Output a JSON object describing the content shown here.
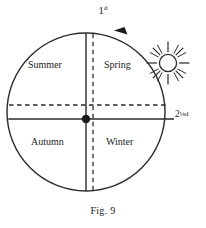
{
  "figure": {
    "caption": "Fig. 9",
    "labels": {
      "top_value": "1",
      "top_superscript": "d",
      "right_whole": "2",
      "right_fraction": "⅛",
      "right_unit": "d"
    },
    "seasons": [
      {
        "name": "Summer",
        "quadrant": "upper-left"
      },
      {
        "name": "Spring",
        "quadrant": "upper-right"
      },
      {
        "name": "Autumn",
        "quadrant": "lower-left"
      },
      {
        "name": "Winter",
        "quadrant": "lower-right"
      }
    ],
    "icons": {
      "sun": "sun-icon",
      "direction_arrow": "counterclockwise-arrow-icon",
      "center_point": "center-dot-icon"
    },
    "colors": {
      "ink": "#1a1a1a",
      "paper": "#ffffff",
      "line": "#2b2b2b"
    },
    "geometry": {
      "circle_center_x": 86,
      "circle_center_y": 112,
      "circle_radius": 79,
      "solid_cross_x": 86,
      "solid_cross_y": 119,
      "dashed_cross_x": 93,
      "dashed_cross_y": 105,
      "sun_center_x": 168,
      "sun_center_y": 63,
      "sun_radius": 9
    }
  }
}
